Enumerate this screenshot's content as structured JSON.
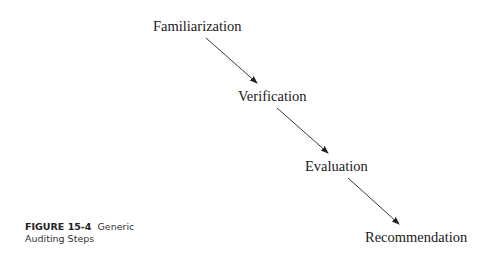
{
  "diagram": {
    "steps": [
      {
        "label": "Familiarization"
      },
      {
        "label": "Verification"
      },
      {
        "label": "Evaluation"
      },
      {
        "label": "Recommendation"
      }
    ],
    "edges": [
      {
        "from": "Familiarization",
        "to": "Verification"
      },
      {
        "from": "Verification",
        "to": "Evaluation"
      },
      {
        "from": "Evaluation",
        "to": "Recommendation"
      }
    ],
    "line_color": "#222222"
  },
  "caption": {
    "figure_label": "FIGURE 15-4",
    "title_line1": "Generic",
    "title_line2": "Auditing Steps"
  }
}
